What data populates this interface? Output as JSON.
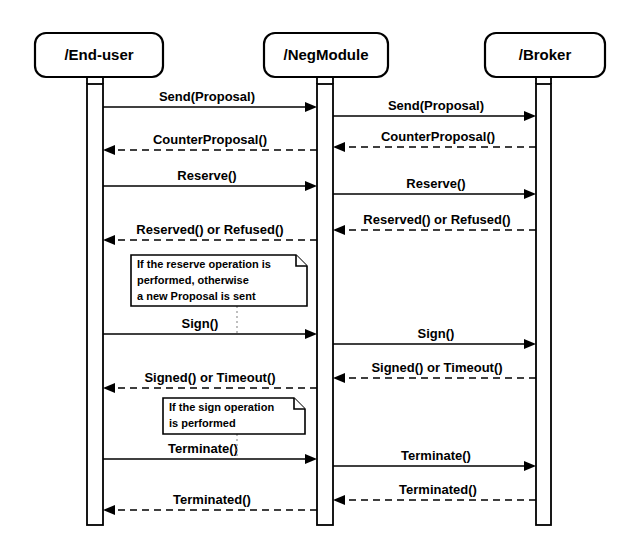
{
  "diagram": {
    "type": "sequence-diagram",
    "colors": {
      "stroke": "#000000",
      "background": "#ffffff",
      "note_connector": "#8a8a8a"
    },
    "lifelines": [
      {
        "id": "end-user",
        "label": "/End-user",
        "box_x": 35,
        "box_y": 33,
        "box_w": 128,
        "box_h": 44,
        "center_x": 99,
        "act_x": 87,
        "act_w": 16
      },
      {
        "id": "negmodule",
        "label": "/NegModule",
        "box_x": 264,
        "box_y": 33,
        "box_w": 124,
        "box_h": 44,
        "center_x": 326,
        "act_x": 317,
        "act_w": 16
      },
      {
        "id": "broker",
        "label": "/Broker",
        "box_x": 485,
        "box_y": 33,
        "box_w": 120,
        "box_h": 44,
        "center_x": 545,
        "act_x": 536,
        "act_w": 15
      }
    ],
    "messages": [
      {
        "id": "m1",
        "label": "Send(Proposal)",
        "from": "end-user",
        "to": "negmodule",
        "y": 107,
        "style": "solid",
        "direction": "right"
      },
      {
        "id": "m2",
        "label": "Send(Proposal)",
        "from": "negmodule",
        "to": "broker",
        "y": 116,
        "style": "solid",
        "direction": "right"
      },
      {
        "id": "m3",
        "label": "CounterProposal()",
        "from": "negmodule",
        "to": "end-user",
        "y": 150,
        "style": "dashed",
        "direction": "left"
      },
      {
        "id": "m4",
        "label": "CounterProposal()",
        "from": "broker",
        "to": "negmodule",
        "y": 147,
        "style": "dashed",
        "direction": "left"
      },
      {
        "id": "m5",
        "label": "Reserve()",
        "from": "end-user",
        "to": "negmodule",
        "y": 186,
        "style": "solid",
        "direction": "right"
      },
      {
        "id": "m6",
        "label": "Reserve()",
        "from": "negmodule",
        "to": "broker",
        "y": 194,
        "style": "solid",
        "direction": "right"
      },
      {
        "id": "m7",
        "label": "Reserved() or Refused()",
        "from": "negmodule",
        "to": "end-user",
        "y": 240,
        "style": "dashed",
        "direction": "left"
      },
      {
        "id": "m8",
        "label": "Reserved() or Refused()",
        "from": "broker",
        "to": "negmodule",
        "y": 230,
        "style": "dashed",
        "direction": "left"
      },
      {
        "id": "m9",
        "label": "Sign()",
        "from": "end-user",
        "to": "negmodule",
        "y": 334,
        "style": "solid",
        "direction": "right"
      },
      {
        "id": "m10",
        "label": "Sign()",
        "from": "negmodule",
        "to": "broker",
        "y": 344,
        "style": "solid",
        "direction": "right"
      },
      {
        "id": "m11",
        "label": "Signed() or Timeout()",
        "from": "negmodule",
        "to": "end-user",
        "y": 388,
        "style": "dashed",
        "direction": "left"
      },
      {
        "id": "m12",
        "label": "Signed() or Timeout()",
        "from": "broker",
        "to": "negmodule",
        "y": 378,
        "style": "dashed",
        "direction": "left"
      },
      {
        "id": "m13",
        "label": "Terminate()",
        "from": "end-user",
        "to": "negmodule",
        "y": 459,
        "style": "solid",
        "direction": "right"
      },
      {
        "id": "m14",
        "label": "Terminate()",
        "from": "negmodule",
        "to": "broker",
        "y": 466,
        "style": "solid",
        "direction": "right"
      },
      {
        "id": "m15",
        "label": "Terminated()",
        "from": "negmodule",
        "to": "end-user",
        "y": 510,
        "style": "dashed",
        "direction": "left"
      },
      {
        "id": "m16",
        "label": "Terminated()",
        "from": "broker",
        "to": "negmodule",
        "y": 500,
        "style": "dashed",
        "direction": "left"
      }
    ],
    "notes": [
      {
        "id": "note-reserve",
        "x": 131,
        "y": 255,
        "w": 176,
        "h": 51,
        "lines": [
          "If the reserve operation is",
          "performed, otherwise",
          "a new Proposal is sent"
        ],
        "connector_x": 237,
        "connector_y1": 306,
        "connector_y2": 334
      },
      {
        "id": "note-sign",
        "x": 163,
        "y": 398,
        "w": 142,
        "h": 36,
        "lines": [
          "If the sign operation",
          "is performed"
        ],
        "connector_x": 237,
        "connector_y1": 434,
        "connector_y2": 459
      }
    ],
    "lifeline_geometry": {
      "stem_top": 77,
      "activation_top": 84,
      "activation_bottom": 525
    }
  }
}
